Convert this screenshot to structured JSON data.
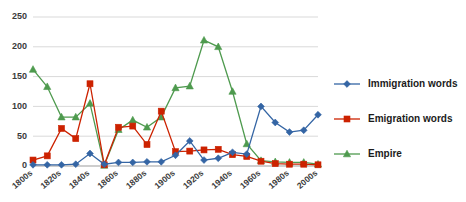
{
  "chart_data": {
    "type": "line",
    "title": "",
    "xlabel": "",
    "ylabel": "",
    "ylim": [
      0,
      250
    ],
    "ytick_values": [
      0,
      50,
      100,
      150,
      200,
      250
    ],
    "ytick_labels": [
      "0",
      "50",
      "100",
      "150",
      "200",
      "250"
    ],
    "grid": true,
    "legend_position": "right",
    "categories": [
      "1800s",
      "1810s",
      "1820s",
      "1830s",
      "1840s",
      "1850s",
      "1860s",
      "1870s",
      "1880s",
      "1890s",
      "1900s",
      "1910s",
      "1920s",
      "1930s",
      "1940s",
      "1950s",
      "1960s",
      "1970s",
      "1980s",
      "1990s",
      "2000s"
    ],
    "xtick_labels": [
      "1800s",
      "1820s",
      "1840s",
      "1860s",
      "1880s",
      "1900s",
      "1920s",
      "1940s",
      "1960s",
      "1980s",
      "2000s"
    ],
    "xtick_indices": [
      0,
      2,
      4,
      6,
      8,
      10,
      12,
      14,
      16,
      18,
      20
    ],
    "series": [
      {
        "name": "Immigration words",
        "color": "#3465A4",
        "marker": "diamond",
        "values": [
          2,
          2,
          2,
          3,
          21,
          3,
          6,
          6,
          7,
          7,
          18,
          42,
          10,
          13,
          23,
          20,
          100,
          73,
          57,
          60,
          86
        ]
      },
      {
        "name": "Emigration words",
        "color": "#CC2200",
        "marker": "square",
        "values": [
          10,
          17,
          63,
          46,
          138,
          2,
          65,
          67,
          36,
          92,
          24,
          25,
          27,
          28,
          19,
          16,
          8,
          4,
          3,
          3,
          2
        ]
      },
      {
        "name": "Empire",
        "color": "#4E9A4E",
        "marker": "triangle",
        "values": [
          162,
          133,
          82,
          82,
          105,
          1,
          61,
          77,
          65,
          82,
          131,
          134,
          211,
          200,
          125,
          37,
          9,
          7,
          6,
          6,
          3
        ]
      }
    ]
  },
  "legend": {
    "entries": [
      {
        "label": "Immigration words"
      },
      {
        "label": "Emigration words"
      },
      {
        "label": "Empire"
      }
    ]
  }
}
